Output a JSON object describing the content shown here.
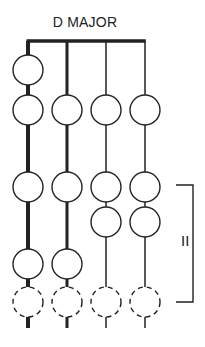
{
  "title": "D MAJOR",
  "bracket_label": "II",
  "colors": {
    "ink": "#222222",
    "background": "#ffffff"
  },
  "strings": [
    {
      "index": 1,
      "x": 28,
      "width": 4
    },
    {
      "index": 2,
      "x": 67,
      "width": 3
    },
    {
      "index": 3,
      "x": 106,
      "width": 1.5
    },
    {
      "index": 4,
      "x": 145,
      "width": 1.5
    }
  ],
  "nut": {
    "y": 41,
    "x1": 28,
    "x2": 145
  },
  "notes": [
    {
      "string": 1,
      "y": 70,
      "style": "solid"
    },
    {
      "string": 1,
      "y": 110,
      "style": "solid"
    },
    {
      "string": 2,
      "y": 110,
      "style": "solid"
    },
    {
      "string": 3,
      "y": 110,
      "style": "solid"
    },
    {
      "string": 4,
      "y": 110,
      "style": "solid"
    },
    {
      "string": 1,
      "y": 187,
      "style": "solid"
    },
    {
      "string": 2,
      "y": 187,
      "style": "solid"
    },
    {
      "string": 3,
      "y": 187,
      "style": "solid"
    },
    {
      "string": 4,
      "y": 187,
      "style": "solid"
    },
    {
      "string": 3,
      "y": 222,
      "style": "solid"
    },
    {
      "string": 4,
      "y": 222,
      "style": "solid"
    },
    {
      "string": 1,
      "y": 264,
      "style": "solid"
    },
    {
      "string": 2,
      "y": 264,
      "style": "solid"
    },
    {
      "string": 1,
      "y": 302,
      "style": "dashed"
    },
    {
      "string": 2,
      "y": 302,
      "style": "dashed"
    },
    {
      "string": 3,
      "y": 302,
      "style": "dashed"
    },
    {
      "string": 4,
      "y": 302,
      "style": "dashed"
    }
  ],
  "bracket": {
    "x_left": 176,
    "x_right": 193,
    "y_top": 185,
    "y_bottom": 302
  }
}
